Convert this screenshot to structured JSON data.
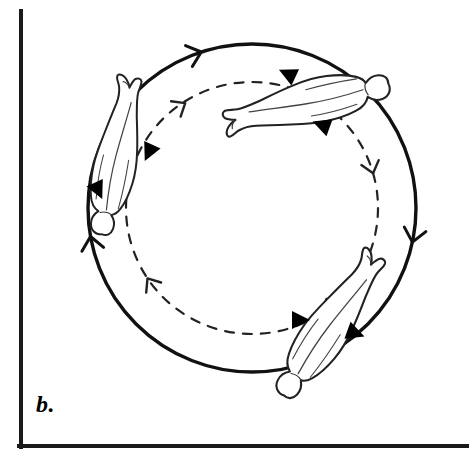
{
  "figure": {
    "panel_label": "b.",
    "caption_text": "b.",
    "colors": {
      "ink": "#111111",
      "frame": "#1a1a1a",
      "figure_outline": "#222222",
      "figure_fill": "#ffffff",
      "marker_fill": "#000000",
      "background": "#ffffff"
    },
    "frame": {
      "name": "axis-frame",
      "left_x": 20,
      "top_y": 10,
      "bottom_y": 447,
      "right_x": 469,
      "stroke_width": 4
    },
    "outer_circle": {
      "name": "solid-rotation-circle",
      "style": "solid",
      "center_x": 252,
      "center_y": 208,
      "radius": 164,
      "stroke_width": 3.4,
      "direction": "clockwise",
      "arrow_angles_deg": [
        -108,
        12,
        84,
        170
      ]
    },
    "inner_circle": {
      "name": "dashed-rotation-circle",
      "style": "dashed",
      "center_x": 252,
      "center_y": 208,
      "radius": 126,
      "stroke_width": 2.2,
      "dash_pattern": "9 9",
      "direction": "clockwise",
      "arrow_angles_deg": [
        -122,
        -16,
        56,
        146
      ]
    },
    "bodies": [
      {
        "id": "body-top",
        "label": "figure-horizontal-top",
        "center_x": 310,
        "center_y": 100,
        "rotation_deg": -12,
        "scale": 1.0,
        "head_side": "left",
        "pose": "horizontal-layout"
      },
      {
        "id": "body-left",
        "label": "figure-headdown-left",
        "center_x": 118,
        "center_y": 160,
        "rotation_deg": 192,
        "scale": 0.95,
        "head_side": "bottom",
        "pose": "inverted-vertical"
      },
      {
        "id": "body-bottom-right",
        "label": "figure-diagonal-bottom-right",
        "center_x": 330,
        "center_y": 330,
        "rotation_deg": 215,
        "scale": 1.0,
        "head_side": "top-right",
        "pose": "diagonal-headup"
      }
    ],
    "direction_markers": [
      {
        "id": "marker-top-left-of-top-body",
        "x": 288,
        "y": 74,
        "rotation_deg": 205,
        "size": 15
      },
      {
        "id": "marker-below-top-body",
        "x": 322,
        "y": 125,
        "rotation_deg": 200,
        "size": 15
      },
      {
        "id": "marker-right-of-left-body",
        "x": 149,
        "y": 152,
        "rotation_deg": 115,
        "size": 15
      },
      {
        "id": "marker-left-of-left-body",
        "x": 98,
        "y": 190,
        "rotation_deg": 65,
        "size": 15
      },
      {
        "id": "marker-left-of-lower-body",
        "x": 300,
        "y": 320,
        "rotation_deg": 0,
        "size": 15
      },
      {
        "id": "marker-right-of-lower-body",
        "x": 355,
        "y": 333,
        "rotation_deg": 20,
        "size": 15
      }
    ]
  }
}
